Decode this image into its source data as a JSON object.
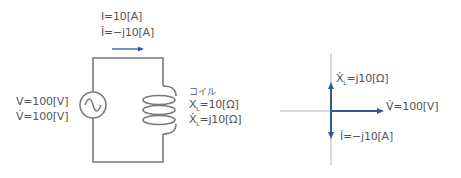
{
  "circuit": {
    "current_magnitude": "I=10[A]",
    "current_phasor": "İ=−j10[A]",
    "voltage_magnitude": "V=100[V]",
    "voltage_phasor": "V̇=100[V]",
    "coil_label": "コイル",
    "reactance_magnitude": "X",
    "reactance_magnitude_sub": "L",
    "reactance_magnitude_value": "=10[Ω]",
    "reactance_phasor": "Ẋ",
    "reactance_phasor_sub": "L",
    "reactance_phasor_value": "=j10[Ω]"
  },
  "phasor_diagram": {
    "reactance": "Ẋ",
    "reactance_sub": "L",
    "reactance_value": "=j10[Ω]",
    "voltage": "V̇=100[V]",
    "current": "İ=−j10[A]"
  },
  "colors": {
    "wire": "#7a7a7a",
    "axis": "#b5b5b5",
    "phasor": "#2f5c96",
    "text": "#555555"
  }
}
